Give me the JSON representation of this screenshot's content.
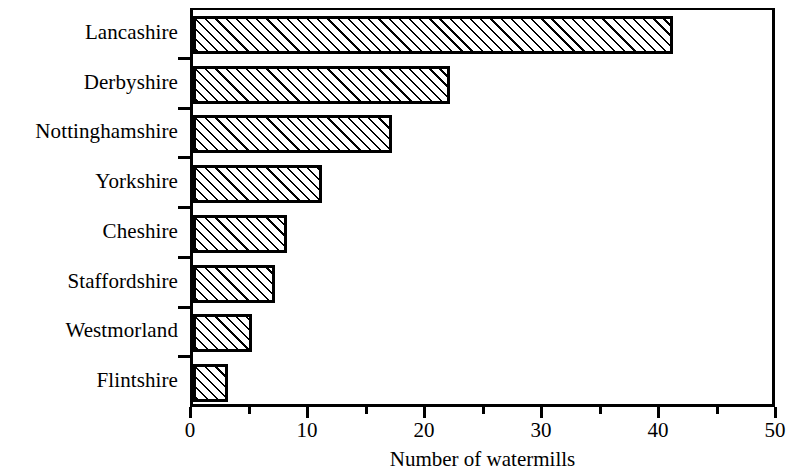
{
  "chart_data": {
    "type": "bar",
    "orientation": "horizontal",
    "title": "",
    "xlabel": "Number of watermills",
    "ylabel": "",
    "categories": [
      "Lancashire",
      "Derbyshire",
      "Nottinghamshire",
      "Yorkshire",
      "Cheshire",
      "Staffordshire",
      "Westmorland",
      "Flintshire"
    ],
    "values": [
      41,
      22,
      17,
      11,
      8,
      7,
      5,
      3
    ],
    "xlim": [
      0,
      50
    ],
    "xticks": [
      0,
      10,
      20,
      30,
      40,
      50
    ],
    "xtick_labels": [
      "0",
      "10",
      "20",
      "30",
      "40",
      "50"
    ],
    "xminor_ticks": [
      5,
      15,
      25,
      35,
      45
    ],
    "grid": false,
    "legend": null,
    "bar_fill": "#ffffff",
    "bar_hatch": "forward-diagonal",
    "bar_edge_color": "#000000",
    "axis_color": "#000000"
  },
  "axis": {
    "x_title": "Number of watermills"
  }
}
